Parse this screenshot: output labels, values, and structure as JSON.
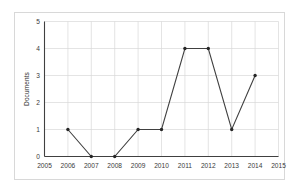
{
  "chart_data": {
    "type": "line",
    "title": "",
    "xlabel": "",
    "ylabel": "Documents",
    "x": [
      2006,
      2007,
      2008,
      2009,
      2010,
      2011,
      2012,
      2013,
      2014
    ],
    "values": [
      1,
      0,
      0,
      1,
      1,
      4,
      4,
      1,
      3
    ],
    "series": [
      {
        "name": "Documents",
        "x": [
          2006,
          2007,
          2008,
          2009,
          2010,
          2011,
          2012,
          2013,
          2014
        ],
        "values": [
          1,
          0,
          0,
          1,
          1,
          4,
          4,
          1,
          3
        ]
      }
    ],
    "xlim": [
      2005,
      2015
    ],
    "ylim": [
      0,
      5
    ],
    "xticks": [
      "2005",
      "2006",
      "2007",
      "2008",
      "2009",
      "2010",
      "2011",
      "2012",
      "2013",
      "2014",
      "2015"
    ],
    "yticks": [
      "0",
      "1",
      "2",
      "3",
      "4",
      "5"
    ],
    "grid": true,
    "legend": "none",
    "line_color": "#404040",
    "marker_color": "#262626",
    "grid_color": "#d9d9d9",
    "axis_color": "#404040",
    "frame_color": "#d8d8d8",
    "background": "#ffffff"
  }
}
